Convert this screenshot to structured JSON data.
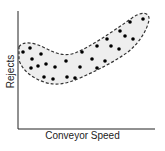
{
  "chart_data": {
    "type": "scatter",
    "title": "",
    "xlabel": "Conveyor Speed",
    "ylabel": "Rejects",
    "grid": false,
    "legend": null,
    "ticks": "none",
    "annotation": "dashed envelope enclosing points (U/J-shaped band), light gray fill",
    "points_px": [
      [
        23,
        52
      ],
      [
        30,
        48
      ],
      [
        32,
        59
      ],
      [
        31,
        68
      ],
      [
        38,
        66
      ],
      [
        41,
        54
      ],
      [
        44,
        77
      ],
      [
        46,
        64
      ],
      [
        53,
        79
      ],
      [
        55,
        67
      ],
      [
        66,
        61
      ],
      [
        67,
        77
      ],
      [
        75,
        78
      ],
      [
        80,
        67
      ],
      [
        82,
        52
      ],
      [
        92,
        59
      ],
      [
        97,
        68
      ],
      [
        97,
        46
      ],
      [
        105,
        61
      ],
      [
        107,
        39
      ],
      [
        111,
        46
      ],
      [
        119,
        49
      ],
      [
        120,
        31
      ],
      [
        125,
        36
      ],
      [
        130,
        22
      ],
      [
        133,
        39
      ],
      [
        143,
        19
      ]
    ],
    "points_relative": {
      "note": "x: 0-100 (left to right along Conveyor Speed), y: 0-100 (bottom to top along Rejects), estimated",
      "x": [
        4,
        9,
        10,
        10,
        15,
        17,
        19,
        20,
        26,
        27,
        35,
        36,
        42,
        45,
        47,
        54,
        58,
        58,
        64,
        65,
        68,
        74,
        75,
        78,
        82,
        84,
        91
      ],
      "y": [
        65,
        69,
        59,
        52,
        53,
        64,
        44,
        55,
        42,
        53,
        58,
        44,
        43,
        53,
        65,
        59,
        52,
        70,
        58,
        76,
        70,
        68,
        83,
        79,
        91,
        76,
        93
      ]
    },
    "colors": {
      "points": "#000000",
      "envelope_stroke": "#333333",
      "envelope_fill": "#eeeeee",
      "axes": "#222222"
    }
  },
  "labels": {
    "x": "Conveyor Speed",
    "y": "Rejects"
  }
}
